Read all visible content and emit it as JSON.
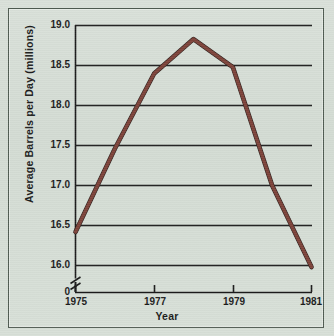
{
  "figure": {
    "background_color": "#d5ddd5",
    "frame_color": "#4e5a50",
    "line_color": "#7a4038",
    "line_shadow_color": "#2b1a17",
    "grid_color": "#1a1a1a",
    "axis_color": "#1a1a1a"
  },
  "chart_data": {
    "type": "line",
    "title": "",
    "xlabel": "Year",
    "ylabel": "Average Barrels per Day (millions)",
    "x": [
      1975,
      1976,
      1977,
      1978,
      1979,
      1980,
      1981
    ],
    "values": [
      16.42,
      17.46,
      18.4,
      18.83,
      18.48,
      17.0,
      15.98
    ],
    "series": [
      {
        "name": "Average Barrels per Day",
        "values": [
          16.42,
          17.46,
          18.4,
          18.83,
          18.48,
          17.0,
          15.98
        ]
      }
    ],
    "xlim": [
      1975,
      1981
    ],
    "ylim": [
      16.0,
      19.0
    ],
    "xtick_labels": [
      "1975",
      "1977",
      "1979",
      "1981"
    ],
    "xtick_values": [
      1975,
      1977,
      1979,
      1981
    ],
    "ytick_labels": [
      "19.0",
      "18.5",
      "18.0",
      "17.5",
      "17.0",
      "16.5",
      "16.0",
      "0"
    ],
    "ytick_values": [
      19.0,
      18.5,
      18.0,
      17.5,
      17.0,
      16.5,
      16.0,
      0
    ],
    "grid": true,
    "grid_axis": "y",
    "legend": false,
    "legend_position": "none",
    "axis_break": {
      "axis": "y",
      "symbol": "zigzag",
      "between": [
        "16.0",
        "0"
      ]
    }
  }
}
